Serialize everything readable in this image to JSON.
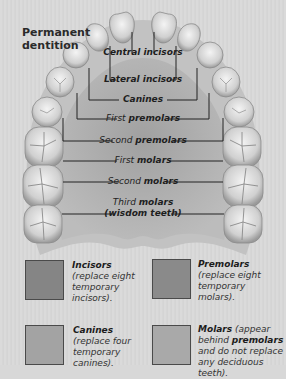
{
  "title": {
    "line1": "Permanent",
    "line2": "dentition"
  },
  "colors": {
    "background": "#d8d8d8",
    "palate_outer": "#b8b8b8",
    "palate_inner": "#9d9d9d",
    "incisors_swatch": "#858585",
    "premolars_swatch": "#8a8a8a",
    "canines_swatch": "#a3a3a3",
    "molars_swatch": "#a9a9a9",
    "leader_line": "#222222"
  },
  "labels": {
    "central_incisors": "Central incisors",
    "lateral_incisors": "Lateral incisors",
    "canines": "Canines",
    "first_premolars_prefix": "First ",
    "first_premolars_bold": "premolars",
    "second_premolars_prefix": "Second ",
    "second_premolars_bold": "premolars",
    "first_molars_prefix": "First ",
    "first_molars_bold": "molars",
    "second_molars_prefix": "Second ",
    "second_molars_bold": "molars",
    "third_molars_prefix": "Third ",
    "third_molars_bold": "molars",
    "wisdom_teeth": "(wisdom teeth)"
  },
  "legend": [
    {
      "name": "Incisors",
      "line1": "(replace eight",
      "line2": "temporary",
      "line3": "incisors)."
    },
    {
      "name": "Premolars",
      "line1": "(replace eight",
      "line2": "temporary",
      "line3": "molars)."
    },
    {
      "name": "Canines",
      "line1": "(replace four",
      "line2": "temporary",
      "line3": "canines)."
    },
    {
      "name": "Molars",
      "suffix": " (appear",
      "line1_prefix": "behind ",
      "line1_bold": "premolars",
      "line2": "and do not replace",
      "line3": "any deciduous teeth)."
    }
  ]
}
